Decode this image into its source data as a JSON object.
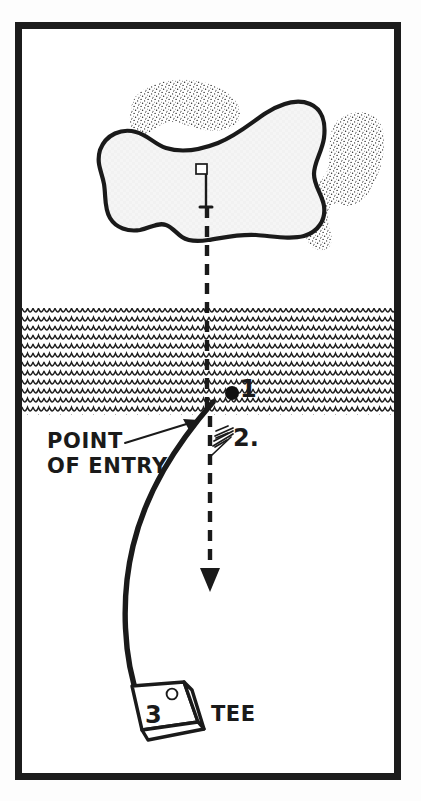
{
  "diagram": {
    "type": "golf-hole-hazard-diagram",
    "style": "hand-drawn black and white line illustration",
    "frame": {
      "border_color": "#1c1c1c",
      "background_color": "#ffffff",
      "outer_margin_color": "#fdfdfd"
    },
    "labels": {
      "point_of_entry": "POINT OF ENTRY",
      "point_of_entry_line1": "POINT",
      "point_of_entry_line2": "OF ENTRY",
      "tee": "TEE",
      "marker_1": "1",
      "marker_2": "2.",
      "marker_3": "3"
    },
    "features": {
      "green_label": "putting green",
      "green_fill": "#f4f4f4",
      "green_outline": "#1a1a1a",
      "water_hazard_label": "water hazard",
      "water_pattern": "scalloped wave rows",
      "bunker_upper_left_label": "sand bunker",
      "bunker_right_label": "sand bunker",
      "bunker_pattern": "stipple dots",
      "flagstick_label": "flagstick with flag",
      "ball_marker_label": "ball position dot",
      "tee_box_label": "tee box",
      "tee_box_circle_label": "tee marker",
      "ball_flight_label": "ball flight path curve",
      "reference_line_label": "dashed line of play",
      "arrow_label": "relief direction arrow",
      "entry_arrow_label": "point of entry pointer arrow",
      "relief_ticks_label": "relief option tick marks"
    },
    "water": {
      "top_y": 308,
      "bottom_y": 415,
      "row_height": 9,
      "scallop_width": 11
    },
    "legend_notes": [
      {
        "number": "1",
        "meaning": "ball position in water hazard"
      },
      {
        "number": "2.",
        "meaning": "relief options along line of play"
      },
      {
        "number": "3",
        "meaning": "tee box / replay from tee"
      }
    ]
  }
}
